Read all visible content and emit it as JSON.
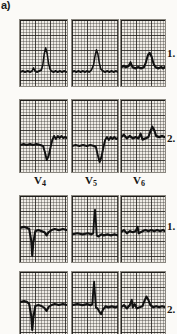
{
  "figure": {
    "panel_letter": "a)",
    "kind": "ecg-strip-grid",
    "paper_background": "#efece6",
    "trace_color": "#111111",
    "grid_color": "#3c3a36",
    "columns": 3,
    "rows": 4,
    "lead_labels": [
      {
        "text": "V",
        "sub": "4"
      },
      {
        "text": "V",
        "sub": "5"
      },
      {
        "text": "V",
        "sub": "6"
      }
    ],
    "row_numbers": [
      {
        "label": "1."
      },
      {
        "label": "2."
      },
      {
        "label": "1."
      },
      {
        "label": "2."
      }
    ],
    "strips": [
      {
        "row": 1,
        "column": 1,
        "lead": "V4",
        "recording": 1,
        "description": "isoelectric baseline with broad tall peaked T wave, small r",
        "path": "M0,52 L4,51 L7,52 L11,51 L14,52 L17,51 L19,48 L21,51 L24,52 L27,51 L30,50 L32,45 L34,34 L36,28 L38,33 L40,43 L42,49 L44,51 L47,52 L50,51 L53,52 L56,51 L59,52 L62,51 L65,52"
      },
      {
        "row": 1,
        "column": 2,
        "lead": "V5",
        "recording": 1,
        "description": "isoelectric baseline with broad tall peaked T wave",
        "path": "M0,52 L3,51 L6,52 L9,51 L12,52 L15,51 L18,52 L21,51 L24,52 L27,50 L30,45 L32,36 L34,30 L36,34 L38,43 L40,49 L43,51 L46,52 L49,51 L52,52 L55,51 L58,52 L61,51 L64,52"
      },
      {
        "row": 1,
        "column": 3,
        "lead": "V6",
        "recording": 1,
        "description": "baseline with small notched complex and rounded T wave",
        "path": "M0,40 L3,39 L5,40 L8,39 L10,36 L12,40 L15,41 L18,40 L21,41 L24,40 L26,36 L28,30 L30,28 L32,31 L34,37 L36,40 L39,41 L42,40 L44,41 L46,40"
      },
      {
        "row": 2,
        "column": 1,
        "lead": "V4",
        "recording": 2,
        "description": "flat baseline, deep S wave, elevated coved ST-T segment",
        "path": "M0,45 L4,44 L7,45 L11,44 L14,45 L18,44 L22,45 L25,46 L27,52 L29,60 L31,56 L33,48 L35,40 L37,36 L39,39 L41,36 L43,38 L45,36 L47,38 L49,37 L51,38"
      },
      {
        "row": 2,
        "column": 2,
        "lead": "V5",
        "recording": 2,
        "description": "flat baseline, deep S wave, elevated ST segment with notched T",
        "path": "M0,46 L4,45 L8,46 L12,45 L16,46 L20,45 L24,46 L26,47 L28,55 L30,62 L32,57 L34,48 L36,40 L38,37 L40,40 L42,37 L44,39 L46,37 L48,39 L50,38"
      },
      {
        "row": 2,
        "column": 3,
        "lead": "V6",
        "recording": 2,
        "description": "small complexes with rounded positive T wave",
        "path": "M0,32 L3,30 L6,33 L9,31 L12,33 L15,32 L18,33 L20,29 L22,34 L25,33 L28,32 L30,27 L32,23 L34,26 L36,31 L39,32 L42,31 L45,32"
      },
      {
        "row": 3,
        "column": 1,
        "lead": "V4",
        "recording": 1,
        "description": "QS complex with deep negative deflection and shallow inverted T",
        "path": "M0,30 L4,29 L7,30 L9,31 L11,42 L12,56 L13,44 L15,33 L18,32 L21,33 L24,34 L26,37 L28,34 L31,32 L34,31 L38,32 L42,31 L46,32"
      },
      {
        "row": 3,
        "column": 2,
        "lead": "V5",
        "recording": 1,
        "description": "tall narrow R spike on flat baseline",
        "path": "M0,36 L6,35 L12,36 L18,35 L22,36 L24,35 L25,22 L26,13 L27,24 L28,37 L30,38 L33,36 L36,37 L40,36 L44,37 L48,36 L52,37"
      },
      {
        "row": 3,
        "column": 3,
        "lead": "V6",
        "recording": 1,
        "description": "low amplitude complexes, nearly flat baseline with small notch",
        "path": "M0,34 L3,32 L6,35 L9,33 L12,34 L15,33 L17,29 L18,35 L20,34 L22,33 L25,32 L28,33 L31,32 L34,33 L37,32 L40,33 L43,32 L45,33"
      },
      {
        "row": 4,
        "column": 1,
        "lead": "V4",
        "recording": 2,
        "description": "QS complex with deep negative deflection, slurred negative T",
        "path": "M0,30 L4,29 L7,30 L9,32 L11,44 L12,58 L13,46 L15,34 L18,33 L21,34 L24,36 L26,39 L28,35 L31,33 L34,32 L38,33 L42,32 L46,33"
      },
      {
        "row": 4,
        "column": 2,
        "lead": "V5",
        "recording": 2,
        "description": "tall narrow R spike followed by small negative T deflection",
        "path": "M0,30 L6,29 L12,30 L17,29 L21,30 L23,29 L24,17 L25,9 L26,20 L27,32 L29,33 L31,36 L33,38 L35,34 L38,31 L41,32 L45,31 L49,32 L52,31"
      },
      {
        "row": 4,
        "column": 3,
        "lead": "V6",
        "recording": 2,
        "description": "small rsR-like complexes with rounded upright T wave",
        "path": "M0,33 L3,31 L6,34 L9,31 L11,26 L12,33 L14,30 L16,34 L19,33 L22,32 L24,27 L26,23 L28,26 L30,31 L33,33 L36,32 L39,33 L42,32 L45,33"
      }
    ]
  }
}
